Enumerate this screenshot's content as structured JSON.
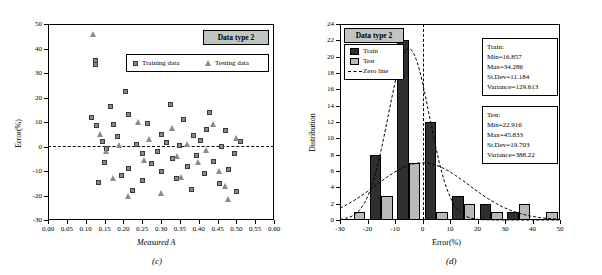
{
  "figure": {
    "panel_c_caption": "(c)",
    "panel_d_caption": "(d)"
  },
  "chart_data": [
    {
      "type": "scatter",
      "panel": "(c)",
      "title": "Data type 2",
      "xlabel": "Measured A",
      "ylabel": "Error(%)",
      "xlim": [
        0.0,
        0.6
      ],
      "ylim": [
        -30,
        50
      ],
      "xticks": [
        "0.00",
        "0.05",
        "0.10",
        "0.15",
        "0.20",
        "0.25",
        "0.30",
        "0.35",
        "0.40",
        "0.45",
        "0.50",
        "0.55",
        "0.60"
      ],
      "yticks": [
        "-30",
        "-20",
        "-10",
        "0",
        "10",
        "20",
        "30",
        "40",
        "50"
      ],
      "grid": false,
      "legend_position": "top-right-inside",
      "annotations": [
        {
          "name": "zero-line",
          "y": 0,
          "style": "dashed"
        }
      ],
      "series": [
        {
          "name": "Training data",
          "marker": "square",
          "color": "#8a8a8a",
          "points": [
            [
              0.115,
              12.0
            ],
            [
              0.125,
              35.0
            ],
            [
              0.125,
              33.5
            ],
            [
              0.13,
              8.5
            ],
            [
              0.135,
              -14.5
            ],
            [
              0.145,
              2.0
            ],
            [
              0.15,
              -6.5
            ],
            [
              0.155,
              -1.0
            ],
            [
              0.165,
              16.5
            ],
            [
              0.175,
              9.0
            ],
            [
              0.185,
              4.0
            ],
            [
              0.195,
              -12.0
            ],
            [
              0.205,
              22.5
            ],
            [
              0.215,
              13.0
            ],
            [
              0.215,
              -9.0
            ],
            [
              0.225,
              -18.0
            ],
            [
              0.235,
              1.0
            ],
            [
              0.25,
              -3.0
            ],
            [
              0.25,
              -14.0
            ],
            [
              0.265,
              9.5
            ],
            [
              0.275,
              -7.0
            ],
            [
              0.29,
              -2.0
            ],
            [
              0.3,
              5.0
            ],
            [
              0.3,
              -10.0
            ],
            [
              0.315,
              1.5
            ],
            [
              0.325,
              17.0
            ],
            [
              0.33,
              -5.0
            ],
            [
              0.34,
              -13.0
            ],
            [
              0.35,
              0.5
            ],
            [
              0.36,
              11.0
            ],
            [
              0.37,
              -8.0
            ],
            [
              0.38,
              -17.5
            ],
            [
              0.385,
              4.5
            ],
            [
              0.395,
              -3.5
            ],
            [
              0.405,
              2.5
            ],
            [
              0.415,
              -11.0
            ],
            [
              0.42,
              7.0
            ],
            [
              0.43,
              14.0
            ],
            [
              0.44,
              -6.0
            ],
            [
              0.455,
              -15.0
            ],
            [
              0.46,
              0.0
            ],
            [
              0.47,
              6.5
            ],
            [
              0.48,
              -9.5
            ],
            [
              0.495,
              -3.0
            ],
            [
              0.5,
              -18.5
            ],
            [
              0.51,
              2.0
            ]
          ]
        },
        {
          "name": "Testing data",
          "marker": "triangle",
          "color": "#8a8a8a",
          "points": [
            [
              0.12,
              46.0
            ],
            [
              0.14,
              5.0
            ],
            [
              0.155,
              -2.0
            ],
            [
              0.175,
              -13.0
            ],
            [
              0.19,
              0.5
            ],
            [
              0.215,
              -20.0
            ],
            [
              0.24,
              10.0
            ],
            [
              0.255,
              -5.5
            ],
            [
              0.27,
              3.0
            ],
            [
              0.3,
              -19.0
            ],
            [
              0.33,
              7.5
            ],
            [
              0.345,
              -4.0
            ],
            [
              0.355,
              -12.5
            ],
            [
              0.37,
              1.0
            ],
            [
              0.4,
              -6.5
            ],
            [
              0.42,
              -1.5
            ],
            [
              0.44,
              9.0
            ],
            [
              0.455,
              -10.0
            ],
            [
              0.47,
              -16.0
            ],
            [
              0.48,
              -21.5
            ],
            [
              0.5,
              3.5
            ]
          ]
        }
      ]
    },
    {
      "type": "bar",
      "panel": "(d)",
      "title": "Data type 2",
      "xlabel": "Error(%)",
      "ylabel": "Distribution",
      "xlim": [
        -30,
        50
      ],
      "ylim": [
        0,
        24
      ],
      "xticks": [
        "-30",
        "-20",
        "-10",
        "0",
        "10",
        "20",
        "30",
        "40",
        "50"
      ],
      "yticks": [
        "0",
        "2",
        "4",
        "6",
        "8",
        "10",
        "12",
        "14",
        "16",
        "18",
        "20",
        "22",
        "24"
      ],
      "grid": false,
      "legend_position": "top-left-inside",
      "bin_centers": [
        -25,
        -15,
        -5,
        5,
        15,
        25,
        35,
        45
      ],
      "series": [
        {
          "name": "Train",
          "color": "#2f2f2f",
          "values": [
            0,
            8,
            22,
            12,
            3,
            2,
            1,
            0
          ]
        },
        {
          "name": "Test",
          "color": "#b9b9b9",
          "values": [
            1,
            3,
            7,
            1,
            2,
            1,
            2,
            1
          ]
        }
      ],
      "annotations": [
        {
          "name": "zero-line",
          "x": 0,
          "style": "dashed",
          "label": "Zero line"
        }
      ],
      "fitted_curves": [
        {
          "name": "train-normal",
          "mean": -5,
          "peak": 21
        },
        {
          "name": "test-normal",
          "mean": 0,
          "peak": 7
        }
      ]
    }
  ],
  "panel_c": {
    "title": "Data type 2",
    "legend": [
      {
        "label": "Training data",
        "marker": "square"
      },
      {
        "label": "Testing data",
        "marker": "triangle"
      }
    ],
    "xlabel": "Measured A",
    "ylabel": "Error(%)",
    "xticks": [
      "0.00",
      "0.05",
      "0.10",
      "0.15",
      "0.20",
      "0.25",
      "0.30",
      "0.35",
      "0.40",
      "0.45",
      "0.50",
      "0.55",
      "0.60"
    ],
    "yticks": [
      "-30",
      "-20",
      "-10",
      "0",
      "10",
      "20",
      "30",
      "40",
      "50"
    ]
  },
  "panel_d": {
    "title": "Data type 2",
    "legend": [
      {
        "label": "Train",
        "marker": "bar-dark"
      },
      {
        "label": "Test",
        "marker": "bar-light"
      },
      {
        "label": "Zero line",
        "marker": "dashed-line"
      }
    ],
    "xlabel": "Error(%)",
    "ylabel": "Distribution",
    "xticks": [
      "-30",
      "-20",
      "-10",
      "0",
      "10",
      "20",
      "30",
      "40",
      "50"
    ],
    "yticks": [
      "0",
      "2",
      "4",
      "6",
      "8",
      "10",
      "12",
      "14",
      "16",
      "18",
      "20",
      "22",
      "24"
    ],
    "stats_train": {
      "heading": "Train:",
      "min": "Min=16.857",
      "max": "Max=34.286",
      "stdev": "St.Dev=11.184",
      "variance": "Variance=129.613"
    },
    "stats_test": {
      "heading": "Test:",
      "min": "Min=22.916",
      "max": "Max=45.833",
      "stdev": "St.Dev=19.703",
      "variance": "Variance=388.22"
    }
  }
}
